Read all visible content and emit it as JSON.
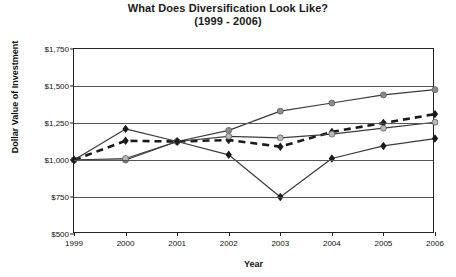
{
  "chart_data": {
    "type": "line",
    "title": "What Does Diversification Look Like?",
    "subtitle": "(1999 - 2006)",
    "xlabel": "Year",
    "ylabel": "Dollar Value of Investment",
    "categories": [
      "1999",
      "2000",
      "2001",
      "2002",
      "2003",
      "2004",
      "2005",
      "2006"
    ],
    "x": [
      1999,
      2000,
      2001,
      2002,
      2003,
      2004,
      2005,
      2006
    ],
    "ylim": [
      500,
      1750
    ],
    "yticks": [
      500,
      750,
      1000,
      1250,
      1500,
      1750
    ],
    "ytick_labels": [
      "$500",
      "$750",
      "$1,000",
      "$1,250",
      "$1,500",
      "$1,750"
    ],
    "xlim": [
      1999,
      2006
    ],
    "grid": true,
    "grid_axis": "y",
    "legend": "none",
    "series": [
      {
        "name": "series-gray-circle",
        "marker": "circle",
        "marker_color": "#8c8c8c",
        "line_style": "solid",
        "line_color": "#3a3a3a",
        "values": [
          1000,
          1000,
          1125,
          1200,
          1330,
          1385,
          1440,
          1475
        ]
      },
      {
        "name": "series-black-diamond-dashed",
        "marker": "diamond",
        "marker_color": "#1a1a1a",
        "line_style": "dashed",
        "line_color": "#1a1a1a",
        "values": [
          1000,
          1130,
          1125,
          1135,
          1090,
          1190,
          1250,
          1310
        ]
      },
      {
        "name": "series-light-gray-circle",
        "marker": "circle",
        "marker_color": "#b8b8b8",
        "line_style": "solid",
        "line_color": "#3a3a3a",
        "values": [
          1000,
          1010,
          1125,
          1160,
          1150,
          1175,
          1215,
          1255
        ]
      },
      {
        "name": "series-black-diamond-volatile",
        "marker": "diamond",
        "marker_color": "#1a1a1a",
        "line_style": "solid",
        "line_color": "#3a3a3a",
        "values": [
          1000,
          1210,
          1125,
          1035,
          750,
          1010,
          1095,
          1145
        ]
      }
    ]
  }
}
